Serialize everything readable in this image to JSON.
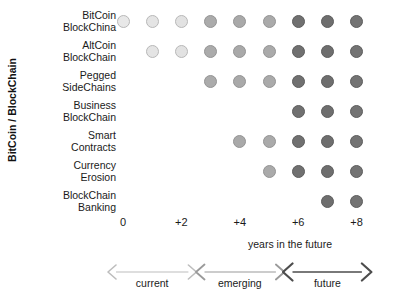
{
  "chart_data": {
    "type": "heatmap",
    "title": "",
    "ylabel": "BitCoin / BlockChain",
    "xlabel": "years in the future",
    "grid": false,
    "legend": "none",
    "x": [
      "0",
      "+1",
      "+2",
      "+3",
      "+4",
      "+5",
      "+6",
      "+7",
      "+8"
    ],
    "xtick_labels": [
      "0",
      "+2",
      "+4",
      "+6",
      "+8"
    ],
    "xtick_columns": [
      1,
      3,
      5,
      7,
      9
    ],
    "categories": [
      "BitCoin BlockChina",
      "AltCoin BlockChain",
      "Pegged SideChains",
      "Business BlockChain",
      "Smart Contracts",
      "Currency Erosion",
      "BlockChain Banking"
    ],
    "rows": [
      {
        "label_line1": "BitCoin",
        "label_line2": "BlockChina",
        "start_column": 1,
        "end_column": 9,
        "values": [
          1,
          1,
          1,
          1,
          1,
          1,
          1,
          1,
          1
        ]
      },
      {
        "label_line1": "AltCoin",
        "label_line2": "BlockChain",
        "start_column": 2,
        "end_column": 9,
        "values": [
          0,
          1,
          1,
          1,
          1,
          1,
          1,
          1,
          1
        ]
      },
      {
        "label_line1": "Pegged",
        "label_line2": "SideChains",
        "start_column": 4,
        "end_column": 9,
        "values": [
          0,
          0,
          0,
          1,
          1,
          1,
          1,
          1,
          1
        ]
      },
      {
        "label_line1": "Business",
        "label_line2": "BlockChain",
        "start_column": 7,
        "end_column": 9,
        "values": [
          0,
          0,
          0,
          0,
          0,
          0,
          1,
          1,
          1
        ]
      },
      {
        "label_line1": "Smart",
        "label_line2": "Contracts",
        "start_column": 5,
        "end_column": 9,
        "values": [
          0,
          0,
          0,
          0,
          1,
          1,
          1,
          1,
          1
        ]
      },
      {
        "label_line1": "Currency",
        "label_line2": "Erosion",
        "start_column": 6,
        "end_column": 9,
        "values": [
          0,
          0,
          0,
          0,
          0,
          1,
          1,
          1,
          1
        ]
      },
      {
        "label_line1": "BlockChain",
        "label_line2": "Banking",
        "start_column": 8,
        "end_column": 9,
        "values": [
          0,
          0,
          0,
          0,
          0,
          0,
          0,
          1,
          1
        ]
      }
    ],
    "column_colors": [
      "#e8e8e8",
      "#e4e4e4",
      "#e2e2e2",
      "#ababab",
      "#a9a9a9",
      "#aaaaaa",
      "#707070",
      "#6e6e6e",
      "#737373"
    ],
    "phase_bands": [
      {
        "label": "current",
        "columns": [
          1,
          3
        ],
        "color": "#bdbdbd"
      },
      {
        "label": "emerging",
        "columns": [
          4,
          6
        ],
        "color": "#9a9a9a"
      },
      {
        "label": "future",
        "columns": [
          7,
          9
        ],
        "color": "#4d4d4d"
      }
    ]
  }
}
